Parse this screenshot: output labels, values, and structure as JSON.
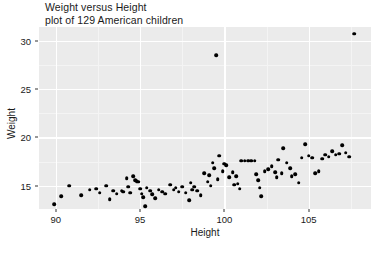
{
  "chart_data": {
    "type": "scatter",
    "title": "Weight versus Height\nplot of 129 American children",
    "xlabel": "Height",
    "ylabel": "Weight",
    "xlim": [
      89.0,
      108.7
    ],
    "ylim": [
      12.6,
      31.4
    ],
    "xticks": [
      90,
      95,
      100,
      105
    ],
    "yticks": [
      15,
      20,
      25,
      30
    ],
    "xticks_minor": [
      92.5,
      97.5,
      102.5,
      107.5
    ],
    "yticks_minor": [
      12.5,
      17.5,
      22.5,
      27.5
    ],
    "grid": true,
    "legend": "none",
    "n_points": 129,
    "point_color": "#000000",
    "panel_color": "#ebebeb",
    "grid_color": "#ffffff",
    "series": [
      {
        "name": "children",
        "points": [
          [
            89.9,
            13.1
          ],
          [
            90.3,
            13.9
          ],
          [
            90.8,
            15.0
          ],
          [
            91.5,
            14.0
          ],
          [
            92.0,
            14.6
          ],
          [
            92.4,
            14.7
          ],
          [
            92.6,
            14.3
          ],
          [
            93.0,
            15.0
          ],
          [
            93.2,
            13.6
          ],
          [
            93.4,
            14.5
          ],
          [
            93.6,
            14.2
          ],
          [
            93.9,
            14.5
          ],
          [
            94.0,
            14.4
          ],
          [
            94.2,
            15.8
          ],
          [
            94.3,
            14.9
          ],
          [
            94.4,
            14.3
          ],
          [
            94.6,
            16.0
          ],
          [
            94.7,
            15.6
          ],
          [
            94.8,
            15.5
          ],
          [
            94.9,
            15.4
          ],
          [
            95.0,
            14.7
          ],
          [
            95.1,
            14.2
          ],
          [
            95.2,
            13.8
          ],
          [
            95.3,
            12.9
          ],
          [
            95.4,
            14.8
          ],
          [
            95.6,
            14.5
          ],
          [
            95.7,
            14.1
          ],
          [
            95.9,
            13.7
          ],
          [
            96.1,
            14.6
          ],
          [
            96.3,
            14.4
          ],
          [
            96.5,
            14.2
          ],
          [
            96.8,
            15.1
          ],
          [
            97.0,
            14.6
          ],
          [
            97.1,
            14.8
          ],
          [
            97.3,
            14.4
          ],
          [
            97.5,
            14.9
          ],
          [
            97.7,
            14.3
          ],
          [
            97.9,
            13.5
          ],
          [
            98.0,
            15.3
          ],
          [
            98.1,
            14.6
          ],
          [
            98.2,
            14.9
          ],
          [
            98.4,
            14.5
          ],
          [
            98.6,
            14.0
          ],
          [
            98.8,
            16.3
          ],
          [
            99.0,
            15.4
          ],
          [
            99.1,
            16.1
          ],
          [
            99.2,
            15.0
          ],
          [
            99.3,
            17.4
          ],
          [
            99.4,
            16.8
          ],
          [
            99.5,
            28.5
          ],
          [
            99.6,
            15.7
          ],
          [
            99.7,
            18.1
          ],
          [
            99.9,
            16.5
          ],
          [
            100.0,
            17.3
          ],
          [
            100.1,
            17.1
          ],
          [
            100.3,
            15.9
          ],
          [
            100.5,
            16.4
          ],
          [
            100.6,
            15.1
          ],
          [
            100.7,
            16.0
          ],
          [
            100.8,
            15.2
          ],
          [
            100.9,
            14.7
          ],
          [
            101.0,
            17.6
          ],
          [
            101.2,
            17.6
          ],
          [
            101.4,
            17.6
          ],
          [
            101.6,
            17.6
          ],
          [
            101.8,
            17.6
          ],
          [
            101.9,
            16.2
          ],
          [
            102.0,
            15.6
          ],
          [
            102.1,
            14.8
          ],
          [
            102.2,
            13.9
          ],
          [
            102.4,
            16.5
          ],
          [
            102.6,
            16.7
          ],
          [
            102.8,
            17.0
          ],
          [
            103.0,
            16.4
          ],
          [
            103.1,
            15.9
          ],
          [
            103.2,
            17.7
          ],
          [
            103.4,
            16.3
          ],
          [
            103.5,
            18.9
          ],
          [
            103.7,
            17.4
          ],
          [
            103.9,
            16.8
          ],
          [
            104.0,
            16.0
          ],
          [
            104.2,
            16.2
          ],
          [
            104.4,
            15.3
          ],
          [
            104.6,
            17.9
          ],
          [
            104.8,
            19.3
          ],
          [
            105.0,
            18.1
          ],
          [
            105.2,
            17.9
          ],
          [
            105.4,
            16.3
          ],
          [
            105.6,
            16.5
          ],
          [
            105.8,
            17.8
          ],
          [
            106.0,
            18.2
          ],
          [
            106.2,
            18.0
          ],
          [
            106.4,
            18.6
          ],
          [
            106.6,
            18.2
          ],
          [
            106.8,
            18.3
          ],
          [
            107.0,
            19.2
          ],
          [
            107.2,
            18.4
          ],
          [
            107.4,
            18.0
          ],
          [
            107.7,
            30.7
          ]
        ]
      }
    ]
  }
}
